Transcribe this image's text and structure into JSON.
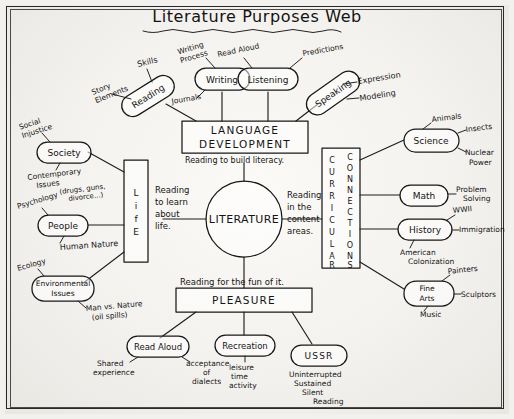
{
  "title": "Literature Purposes Web",
  "center": {
    "label": "LITERATURE"
  },
  "branches": {
    "language": {
      "box_line1": "LANGUAGE",
      "box_line2": "DEVELOPMENT",
      "link_text": "Reading to build literacy.",
      "nodes": [
        {
          "label": "Reading",
          "satellites": [
            "Story\nElements",
            "Skills"
          ]
        },
        {
          "label": "Writing",
          "satellites": [
            "Writing\nProcess",
            "Journals"
          ]
        },
        {
          "label": "Listening",
          "satellites": [
            "Read Aloud",
            "Predictions"
          ]
        },
        {
          "label": "Speaking",
          "satellites": [
            "Expression",
            "Modeling"
          ]
        }
      ]
    },
    "life": {
      "box_label": "LIFE",
      "link_text": "Reading to learn about life.",
      "nodes": [
        {
          "label": "Society",
          "satellites": [
            "Social\nInjustice",
            "Contemporary\nIssues",
            "(drugs, guns,\ndivorce...)"
          ]
        },
        {
          "label": "People",
          "satellites": [
            "Psychology",
            "Human Nature"
          ]
        },
        {
          "label": "Environmental\nIssues",
          "satellites": [
            "Ecology",
            "Man vs. Nature\n(oil spills)"
          ]
        }
      ]
    },
    "curricular": {
      "box_label_left": "CURRICULAR",
      "box_label_right": "CONNECTIONS",
      "link_text": "Reading in the content areas.",
      "nodes": [
        {
          "label": "Science",
          "satellites": [
            "Animals",
            "Insects",
            "Nuclear\nPower"
          ]
        },
        {
          "label": "Math",
          "satellites": [
            "Problem\nSolving"
          ]
        },
        {
          "label": "History",
          "satellites": [
            "WWII",
            "Immigration",
            "American\nColonization"
          ]
        },
        {
          "label": "Fine\nArts",
          "satellites": [
            "Painters",
            "Sculptors",
            "Music"
          ]
        }
      ]
    },
    "pleasure": {
      "box_label": "PLEASURE",
      "link_text": "Reading for the fun of it.",
      "nodes": [
        {
          "label": "Read Aloud",
          "satellites": [
            "Shared\nexperience",
            "acceptance\nof\ndialects"
          ]
        },
        {
          "label": "Recreation",
          "satellites": [
            "leisure\ntime\nactivity"
          ]
        },
        {
          "label": "USSR",
          "satellites": [
            "Uninterrupted\nSustained\nSilent\nReading"
          ]
        }
      ]
    }
  },
  "labels": {
    "title": "Literature Purposes Web",
    "literature": "LITERATURE",
    "language_1": "LANGUAGE",
    "language_2": "DEVELOPMENT",
    "life": "LIFE",
    "curricular": "CURRICULAR",
    "connections": "CONNECTIONS",
    "pleasure": "PLEASURE",
    "reading": "Reading",
    "writing": "Writing",
    "listening": "Listening",
    "speaking": "Speaking",
    "story_elements_1": "Story",
    "story_elements_2": "Elements",
    "skills": "Skills",
    "writing_process_1": "Writing",
    "writing_process_2": "Process",
    "journals": "Journals",
    "read_aloud_top": "Read Aloud",
    "predictions": "Predictions",
    "expression": "Expression",
    "modeling": "Modeling",
    "link_language": "Reading to build literacy.",
    "link_life_1": "Reading",
    "link_life_2": "to learn",
    "link_life_3": "about",
    "link_life_4": "life.",
    "link_curricular_1": "Reading",
    "link_curricular_2": "in the",
    "link_curricular_3": "content",
    "link_curricular_4": "areas.",
    "link_pleasure": "Reading for the fun of it.",
    "society": "Society",
    "social_injustice_1": "Social",
    "social_injustice_2": "Injustice",
    "contemporary_1": "Contemporary",
    "contemporary_2": "Issues",
    "contemporary_3": "(drugs, guns,",
    "contemporary_4": "divorce...)",
    "people": "People",
    "psychology": "Psychology",
    "human_nature": "Human Nature",
    "environmental_1": "Environmental",
    "environmental_2": "Issues",
    "ecology": "Ecology",
    "man_vs_nature_1": "Man vs. Nature",
    "man_vs_nature_2": "(oil spills)",
    "science": "Science",
    "animals": "Animals",
    "insects": "Insects",
    "nuclear_1": "Nuclear",
    "nuclear_2": "Power",
    "math": "Math",
    "problem_1": "Problem",
    "problem_2": "Solving",
    "history": "History",
    "wwii": "WWII",
    "immigration": "Immigration",
    "american_1": "American",
    "american_2": "Colonization",
    "fine_arts_1": "Fine",
    "fine_arts_2": "Arts",
    "painters": "Painters",
    "sculptors": "Sculptors",
    "music": "Music",
    "read_aloud_bottom": "Read Aloud",
    "shared_1": "Shared",
    "shared_2": "experience",
    "acceptance_1": "acceptance",
    "acceptance_2": "of",
    "acceptance_3": "dialects",
    "recreation": "Recreation",
    "leisure_1": "leisure",
    "leisure_2": "time",
    "leisure_3": "activity",
    "ussr": "USSR",
    "ussr_1": "Uninterrupted",
    "ussr_2": "Sustained",
    "ussr_3": "Silent",
    "ussr_4": "Reading"
  },
  "colors": {
    "ink": "#1c1c1c",
    "paper": "#f4f2ef"
  }
}
